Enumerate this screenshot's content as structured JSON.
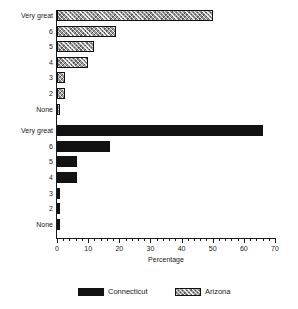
{
  "chart_data": {
    "type": "bar",
    "orientation": "horizontal",
    "title": "",
    "xlabel": "Percentage",
    "ylabel": "",
    "xlim": [
      0,
      70
    ],
    "xticks": [
      0,
      10,
      20,
      30,
      40,
      50,
      60,
      70
    ],
    "xtick_labels": [
      "0",
      "10",
      "20",
      "30",
      "40",
      "50",
      "60",
      "70"
    ],
    "minor_tick_step": 2,
    "grid": false,
    "legend_position": "bottom",
    "groups": [
      {
        "name": "Arizona",
        "fill": "hatched",
        "color": "#9a9a9a",
        "categories": [
          "Very great",
          "6",
          "5",
          "4",
          "3",
          "2",
          "None"
        ],
        "values": [
          50,
          19,
          12,
          10,
          2.5,
          2.5,
          1
        ]
      },
      {
        "name": "Connecticut",
        "fill": "solid",
        "color": "#121212",
        "categories": [
          "Very great",
          "6",
          "5",
          "4",
          "3",
          "2",
          "None"
        ],
        "values": [
          66,
          17,
          6.5,
          6.5,
          1,
          1,
          1
        ]
      }
    ],
    "legend": [
      {
        "label": "Connecticut",
        "fill": "solid",
        "color": "#121212"
      },
      {
        "label": "Arizona",
        "fill": "hatched",
        "color": "#9a9a9a"
      }
    ]
  }
}
